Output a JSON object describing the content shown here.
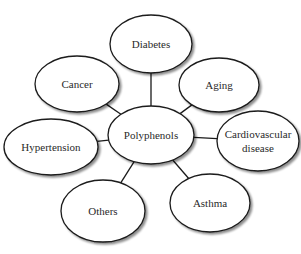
{
  "diagram": {
    "type": "hub-and-spoke",
    "stroke_color": "#1a1a1a",
    "fill_color": "#ffffff",
    "shadow_color": "#bdbdbd",
    "center": {
      "id": "polyphenols",
      "label": "Polyphenols",
      "cx": 151,
      "cy": 135,
      "rx": 43,
      "ry": 29
    },
    "nodes": [
      {
        "id": "diabetes",
        "label": "Diabetes",
        "lines": [
          "Diabetes"
        ],
        "cx": 151,
        "cy": 44,
        "rx": 41,
        "ry": 29
      },
      {
        "id": "aging",
        "label": "Aging",
        "lines": [
          "Aging"
        ],
        "cx": 219,
        "cy": 85,
        "rx": 40,
        "ry": 27
      },
      {
        "id": "cardiovascular-disease",
        "label": "Cardiovascular disease",
        "lines": [
          "Cardiovascular",
          "disease"
        ],
        "cx": 258,
        "cy": 141,
        "rx": 41,
        "ry": 30
      },
      {
        "id": "asthma",
        "label": "Asthma",
        "lines": [
          "Asthma"
        ],
        "cx": 210,
        "cy": 203,
        "rx": 40,
        "ry": 29
      },
      {
        "id": "others",
        "label": "Others",
        "lines": [
          "Others"
        ],
        "cx": 103,
        "cy": 211,
        "rx": 42,
        "ry": 31
      },
      {
        "id": "hypertension",
        "label": "Hypertension",
        "lines": [
          "Hypertension"
        ],
        "cx": 51,
        "cy": 147,
        "rx": 47,
        "ry": 28
      },
      {
        "id": "cancer",
        "label": "Cancer",
        "lines": [
          "Cancer"
        ],
        "cx": 77,
        "cy": 84,
        "rx": 42,
        "ry": 28
      }
    ]
  }
}
